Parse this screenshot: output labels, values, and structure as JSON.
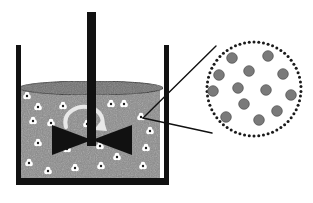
{
  "figure": {
    "width": 313,
    "height": 203,
    "background_color": "#ffffff"
  },
  "colors": {
    "vessel_outline": "#111111",
    "shaft": "#111111",
    "impeller": "#111111",
    "liquid_fill": "#8a8a8a",
    "liquid_surface": "#6f6f6f",
    "liquid_surface_outline": "#2b2b2b",
    "particle_body": "#ffffff",
    "particle_core": "#1a1a1a",
    "rotation_arrow": "#e8e8e8",
    "callout_dot": "#1a1a1a",
    "callout_line": "#111111",
    "magnified_particle": "#7a7a7a",
    "magnified_particle_edge": "#4d4d4d"
  },
  "vessel": {
    "name": "beaker",
    "left_wall_x": 16,
    "right_wall_x": 164,
    "wall_thickness": 5,
    "wall_top_y": 45,
    "bottom_y": 178,
    "bottom_thickness": 6,
    "inner_left": 21,
    "inner_right": 160,
    "liquid_top_y": 88,
    "liquid_bottom_y": 178,
    "surface_ellipse": {
      "cx": 91,
      "cy": 88,
      "rx": 72,
      "ry": 7
    }
  },
  "shaft": {
    "name": "stirrer-shaft",
    "x": 87,
    "width": 9,
    "top_y": 12,
    "bottom_y": 146
  },
  "impeller": {
    "name": "impeller-blade",
    "center_x": 92,
    "center_y": 140,
    "half_width": 40,
    "half_height": 15
  },
  "rotation_arrow": {
    "name": "rotation-arrow",
    "direction": "clockwise",
    "path": "M 66 127 C 62 112, 78 104, 91 108 C 101 111, 104 119, 102 126",
    "head": "103,118 107,131 94,130",
    "stroke_width": 4
  },
  "particles": {
    "label": "suspended particles",
    "count": 21,
    "radius": 3.4,
    "core_radius": 1.2,
    "positions": [
      {
        "x": 38,
        "y": 107
      },
      {
        "x": 63,
        "y": 106
      },
      {
        "x": 33,
        "y": 121
      },
      {
        "x": 51,
        "y": 123
      },
      {
        "x": 111,
        "y": 104
      },
      {
        "x": 124,
        "y": 104
      },
      {
        "x": 141,
        "y": 117
      },
      {
        "x": 126,
        "y": 140
      },
      {
        "x": 38,
        "y": 143
      },
      {
        "x": 29,
        "y": 163
      },
      {
        "x": 48,
        "y": 171
      },
      {
        "x": 75,
        "y": 168
      },
      {
        "x": 101,
        "y": 166
      },
      {
        "x": 117,
        "y": 157
      },
      {
        "x": 143,
        "y": 166
      },
      {
        "x": 150,
        "y": 131
      },
      {
        "x": 100,
        "y": 146
      },
      {
        "x": 146,
        "y": 148
      },
      {
        "x": 67,
        "y": 149
      },
      {
        "x": 87,
        "y": 124
      },
      {
        "x": 27,
        "y": 96
      }
    ]
  },
  "callout": {
    "name": "magnification-callout",
    "source_point": {
      "x": 143,
      "y": 118
    },
    "lines": [
      {
        "x1": 143,
        "y1": 118,
        "x2": 216,
        "y2": 46
      },
      {
        "x1": 143,
        "y1": 118,
        "x2": 212,
        "y2": 133
      }
    ],
    "line_width": 1.4
  },
  "magnified_circle": {
    "name": "magnified-region",
    "cx": 254,
    "cy": 89,
    "r": 47,
    "dot_radius": 1.5,
    "dot_count": 62,
    "particle_radius": 5.3,
    "particle_count": 13,
    "particles": [
      {
        "x": 232,
        "y": 58
      },
      {
        "x": 268,
        "y": 56
      },
      {
        "x": 249,
        "y": 71
      },
      {
        "x": 219,
        "y": 75
      },
      {
        "x": 283,
        "y": 74
      },
      {
        "x": 213,
        "y": 91
      },
      {
        "x": 238,
        "y": 88
      },
      {
        "x": 266,
        "y": 90
      },
      {
        "x": 291,
        "y": 95
      },
      {
        "x": 244,
        "y": 104
      },
      {
        "x": 277,
        "y": 111
      },
      {
        "x": 226,
        "y": 117
      },
      {
        "x": 259,
        "y": 120
      }
    ]
  },
  "accessibility": {
    "description": "Cross-section drawing of a stirred tank: a beaker holds gray liquid with small white particles suspended throughout; a central vertical shaft drives a bowtie-shaped impeller while a curved arrow indicates rotation. Two straight lines lead from one particle to a dotted circle at the right that magnifies the region, showing thirteen gray spherical particles."
  }
}
